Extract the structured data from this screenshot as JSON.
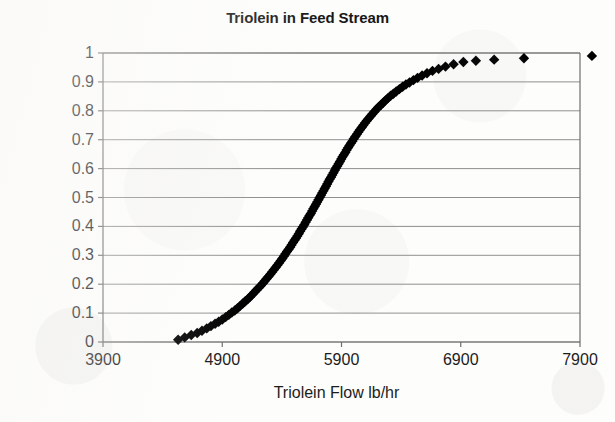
{
  "chart_data": {
    "type": "scatter",
    "title": "Triolein in Feed Stream",
    "xlabel": "Triolein Flow lb/hr",
    "ylabel": "Cummulative Probability",
    "xlim": [
      3900,
      7900
    ],
    "ylim": [
      0,
      1
    ],
    "xticks": [
      3900,
      4900,
      5900,
      6900,
      7900
    ],
    "xtick_labels": [
      "3900",
      "4900",
      "5900",
      "6900",
      "7900"
    ],
    "yticks": [
      0,
      0.1,
      0.2,
      0.3,
      0.4,
      0.5,
      0.6,
      0.7,
      0.8,
      0.9,
      1
    ],
    "ytick_labels": [
      "0",
      "0.1",
      "0.2",
      "0.3",
      "0.4",
      "0.5",
      "0.6",
      "0.7",
      "0.8",
      "0.9",
      "1"
    ],
    "grid": "horizontal",
    "legend": "none",
    "marker": "diamond",
    "marker_color": "#000000",
    "series": [
      {
        "name": "Triolein flow cumulative distribution",
        "x": [
          4530,
          4585,
          4640,
          4690,
          4730,
          4770,
          4805,
          4840,
          4870,
          4900,
          4928,
          4955,
          4980,
          5005,
          5028,
          5050,
          5072,
          5093,
          5113,
          5133,
          5152,
          5170,
          5188,
          5206,
          5223,
          5240,
          5256,
          5272,
          5288,
          5303,
          5318,
          5333,
          5348,
          5362,
          5376,
          5390,
          5404,
          5417,
          5430,
          5443,
          5456,
          5469,
          5481,
          5494,
          5506,
          5518,
          5530,
          5542,
          5553,
          5565,
          5576,
          5588,
          5599,
          5610,
          5621,
          5632,
          5643,
          5654,
          5664,
          5675,
          5686,
          5696,
          5707,
          5717,
          5728,
          5738,
          5749,
          5759,
          5770,
          5780,
          5791,
          5801,
          5812,
          5822,
          5833,
          5844,
          5854,
          5865,
          5876,
          5887,
          5898,
          5909,
          5920,
          5932,
          5943,
          5955,
          5967,
          5979,
          5991,
          6003,
          6016,
          6029,
          6042,
          6055,
          6069,
          6083,
          6097,
          6112,
          6127,
          6143,
          6159,
          6176,
          6193,
          6211,
          6230,
          6249,
          6269,
          6290,
          6312,
          6335,
          6359,
          6385,
          6412,
          6440,
          6470,
          6503,
          6538,
          6576,
          6617,
          6663,
          6714,
          6772,
          6840,
          6922,
          7027,
          7180,
          7430,
          8000
        ],
        "y": [
          0.008,
          0.016,
          0.024,
          0.031,
          0.039,
          0.047,
          0.055,
          0.063,
          0.07,
          0.078,
          0.086,
          0.094,
          0.102,
          0.109,
          0.117,
          0.125,
          0.133,
          0.141,
          0.148,
          0.156,
          0.164,
          0.172,
          0.18,
          0.188,
          0.195,
          0.203,
          0.211,
          0.219,
          0.227,
          0.234,
          0.242,
          0.25,
          0.258,
          0.266,
          0.273,
          0.281,
          0.289,
          0.297,
          0.305,
          0.313,
          0.32,
          0.328,
          0.336,
          0.344,
          0.352,
          0.359,
          0.367,
          0.375,
          0.383,
          0.391,
          0.398,
          0.406,
          0.414,
          0.422,
          0.43,
          0.438,
          0.445,
          0.453,
          0.461,
          0.469,
          0.477,
          0.484,
          0.492,
          0.5,
          0.508,
          0.516,
          0.523,
          0.531,
          0.539,
          0.547,
          0.555,
          0.563,
          0.57,
          0.578,
          0.586,
          0.594,
          0.602,
          0.609,
          0.617,
          0.625,
          0.633,
          0.641,
          0.648,
          0.656,
          0.664,
          0.672,
          0.68,
          0.688,
          0.695,
          0.703,
          0.711,
          0.719,
          0.727,
          0.734,
          0.742,
          0.75,
          0.758,
          0.766,
          0.773,
          0.781,
          0.789,
          0.797,
          0.805,
          0.813,
          0.82,
          0.828,
          0.836,
          0.844,
          0.852,
          0.859,
          0.867,
          0.875,
          0.883,
          0.891,
          0.898,
          0.906,
          0.914,
          0.922,
          0.93,
          0.938,
          0.945,
          0.953,
          0.961,
          0.969,
          0.973,
          0.977,
          0.982,
          0.99
        ]
      }
    ],
    "annotations": {
      "median_x": 5700,
      "median_y": 0.5,
      "outliers": [
        {
          "x": 7180,
          "y": 0.977
        },
        {
          "x": 7430,
          "y": 0.982
        },
        {
          "x": 8000,
          "y": 0.99
        }
      ]
    }
  }
}
